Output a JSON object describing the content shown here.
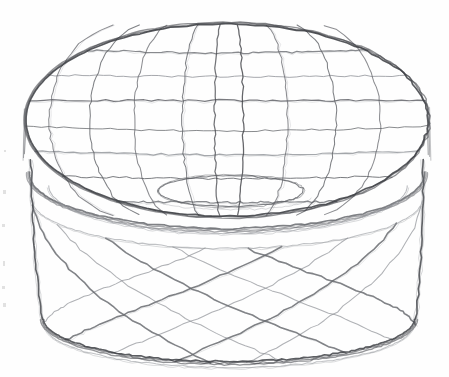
{
  "artwork": {
    "title": "Pencil sketch of a round lidded box",
    "subject": "round-lidded-container",
    "medium": "graphite pencil line drawing on white paper",
    "description": "A three-quarter view perspective sketch of a cylindrical box with an overhanging lid. The lid's top surface carries a curved perspective grid; the cylindrical body is covered in a diagonal diamond lattice.",
    "canvas": {
      "width": 449,
      "height": 377
    },
    "background_color": "#fefefe",
    "line_color": "#5f6166",
    "line_color_light": "#8d9096",
    "line_color_dark": "#3d3f44"
  },
  "geometry": {
    "lid_top": {
      "cx": 227,
      "cy": 120,
      "rx": 202,
      "ry": 97,
      "label": "lid-top-ellipse"
    },
    "lid_bottom": {
      "cx": 227,
      "cy": 174,
      "rx": 199,
      "ry": 56,
      "label": "lid-bottom-ellipse"
    },
    "lid_skirt_inner": {
      "cx": 228,
      "cy": 186,
      "rx": 180,
      "ry": 48,
      "label": "lid-skirt-ellipse"
    },
    "recess": {
      "cx": 231,
      "cy": 191,
      "rx": 73,
      "ry": 16,
      "label": "lid-recess-ellipse"
    },
    "body_top": {
      "cx": 227,
      "cy": 199,
      "rx": 196,
      "ry": 50,
      "label": "body-top-ellipse"
    },
    "body_bottom": {
      "cx": 229,
      "cy": 319,
      "rx": 187,
      "ry": 44,
      "label": "body-bottom-ellipse"
    },
    "body_foot": {
      "cx": 229,
      "cy": 326,
      "rx": 184,
      "ry": 42,
      "label": "body-foot-ellipse"
    },
    "body_left_x_top": 31,
    "body_left_x_bottom": 42,
    "body_right_x_top": 423,
    "body_right_x_bottom": 416
  },
  "grid": {
    "lid_parallels_count": 7,
    "lid_meridians_count": 9,
    "lid_parallel_fractions": [
      -0.72,
      -0.46,
      -0.2,
      0.06,
      0.32,
      0.58,
      0.84
    ],
    "lid_meridian_fractions": [
      -0.88,
      -0.68,
      -0.46,
      -0.22,
      -0.06,
      0.08,
      0.3,
      0.54,
      0.76
    ],
    "body_lattice_left_count": 11,
    "body_lattice_right_count": 11,
    "body_lattice_note": "two crossing families of curved diagonals forming diamonds"
  },
  "strokes": {
    "jitter_amplitude": 1.15,
    "overshoot": 9,
    "base_width": 1.05,
    "heavy_width": 1.65,
    "doubled_outline_passes": 3
  },
  "artifacts": {
    "margin_specks": [
      {
        "x": 3,
        "y": 190,
        "w": 3,
        "h": 4
      },
      {
        "x": 2,
        "y": 224,
        "w": 3,
        "h": 3
      },
      {
        "x": 3,
        "y": 261,
        "w": 2,
        "h": 5
      },
      {
        "x": 2,
        "y": 286,
        "w": 3,
        "h": 3
      },
      {
        "x": 3,
        "y": 303,
        "w": 3,
        "h": 4
      },
      {
        "x": 4,
        "y": 150,
        "w": 2,
        "h": 2
      }
    ]
  }
}
